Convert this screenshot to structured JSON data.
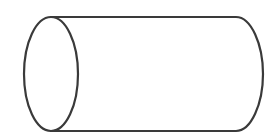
{
  "diagram": {
    "shape": "cylinder",
    "orientation": "horizontal",
    "stroke_color": "#3a3a3a",
    "fill_color": "#ffffff",
    "background": "#ffffff",
    "stroke_width": 2.2,
    "left_face": {
      "cx": 51,
      "cy": 74,
      "rx": 27,
      "ry": 57
    },
    "body": {
      "top_y": 17,
      "bottom_y": 131,
      "left_x": 51,
      "right_x": 236
    },
    "right_end": {
      "max_x": 263,
      "cy": 74
    }
  }
}
